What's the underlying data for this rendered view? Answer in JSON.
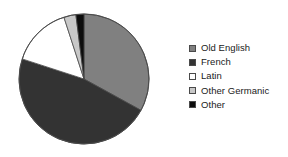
{
  "chart_data": {
    "type": "pie",
    "title": "",
    "subtitle": "",
    "xlabel": "",
    "ylabel": "",
    "grid": false,
    "legend_position": "right",
    "start_angle_deg": 0,
    "direction": "clockwise",
    "categories": [
      "Old English",
      "French",
      "Latin",
      "Other Germanic",
      "Other"
    ],
    "values": [
      33,
      47,
      15,
      3,
      2
    ],
    "slices": [
      {
        "label": "Old English",
        "value": 33,
        "color": "#808080",
        "start_angle_deg": 0,
        "end_angle_deg": 118.8
      },
      {
        "label": "French",
        "value": 47,
        "color": "#333333",
        "start_angle_deg": 118.8,
        "end_angle_deg": 288.0
      },
      {
        "label": "Latin",
        "value": 15,
        "color": "#ffffff",
        "start_angle_deg": 288.0,
        "end_angle_deg": 342.0
      },
      {
        "label": "Other Germanic",
        "value": 3,
        "color": "#c8c8c8",
        "start_angle_deg": 342.0,
        "end_angle_deg": 352.8
      },
      {
        "label": "Other",
        "value": 2,
        "color": "#0d0d0d",
        "start_angle_deg": 352.8,
        "end_angle_deg": 360.0
      }
    ],
    "annotations": []
  },
  "legend": {
    "items": [
      {
        "label": "Old English",
        "color": "#808080"
      },
      {
        "label": "French",
        "color": "#333333"
      },
      {
        "label": "Latin",
        "color": "#ffffff"
      },
      {
        "label": "Other Germanic",
        "color": "#c8c8c8"
      },
      {
        "label": "Other",
        "color": "#0d0d0d"
      }
    ]
  },
  "style": {
    "outline_color": "#4a4a4a",
    "background": "#ffffff",
    "text_color": "#1a1a1a"
  },
  "geometry": {
    "center_x": 84,
    "center_y": 79,
    "radius": 65
  }
}
